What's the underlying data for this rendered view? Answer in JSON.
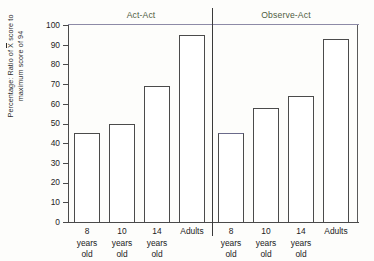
{
  "chart_data": {
    "type": "bar",
    "title": "",
    "xlabel": "",
    "ylabel_line1": "Percentage: Ratio of X score to",
    "ylabel_line2": "maximum score of 94",
    "ylabel_overbar_token": "X",
    "ylim": [
      0,
      100
    ],
    "yticks": [
      0,
      10,
      20,
      30,
      40,
      50,
      60,
      70,
      80,
      90,
      100
    ],
    "grid": false,
    "legend": "none",
    "panels": [
      {
        "title": "Act-Act",
        "categories": [
          "8 years old",
          "10 years old",
          "14 years old",
          "Adults"
        ],
        "values": [
          45,
          50,
          69,
          95
        ]
      },
      {
        "title": "Observe-Act",
        "categories": [
          "8 years old",
          "10 years old",
          "14 years old",
          "Adults"
        ],
        "values": [
          45,
          58,
          64,
          93
        ]
      }
    ],
    "category_lines": [
      [
        "8",
        "years",
        "old"
      ],
      [
        "10",
        "years",
        "old"
      ],
      [
        "14",
        "years",
        "old"
      ],
      [
        "Adults",
        "",
        ""
      ]
    ],
    "colors": {
      "bar_fill": "#ffffff",
      "bar_stroke": "#4b4b4b",
      "axis": "#4a4a4a",
      "top_rule": "#8d8aa6",
      "panel_title": "#4f5c42",
      "background": "#fdfdfb"
    }
  }
}
